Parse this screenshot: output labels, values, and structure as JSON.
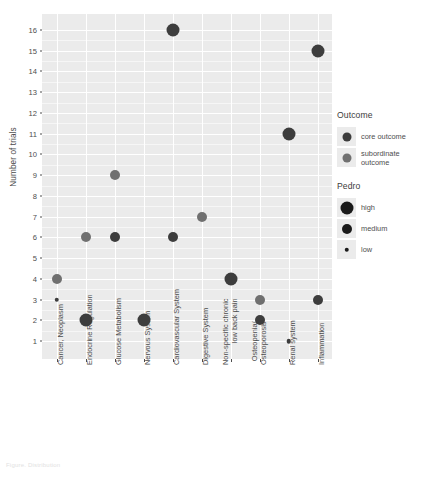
{
  "chart_data": {
    "type": "scatter",
    "title": "",
    "xlabel": "",
    "ylabel": "Number of trials",
    "ylim": [
      1,
      16
    ],
    "yticks": [
      1,
      2,
      3,
      4,
      5,
      6,
      7,
      8,
      9,
      10,
      11,
      12,
      13,
      14,
      15,
      16
    ],
    "grid": true,
    "legend_position": "right",
    "categories": [
      "Cancer, Neoplasm",
      "Endocrine Regulation",
      "Glucose Metabolism",
      "Nervous System",
      "Cardiovascular System",
      "Digestive System",
      "Non-specific chronic\nlow back pain",
      "Osteopenia/\nOsteoporosis",
      "Renal system",
      "Inflammation"
    ],
    "size_legend": {
      "title": "Pedro",
      "levels": [
        "high",
        "medium",
        "low"
      ],
      "diameters_px": [
        13,
        10,
        4.5
      ]
    },
    "color_legend": {
      "title": "Outcome",
      "levels": [
        "core outcome",
        "subordinate outcome"
      ],
      "colors": [
        "#3d3d3d",
        "#707070"
      ]
    },
    "points": [
      {
        "category": "Cancer, Neoplasm",
        "y": 4,
        "outcome": "subordinate outcome",
        "pedro": "medium"
      },
      {
        "category": "Cancer, Neoplasm",
        "y": 3,
        "outcome": "core outcome",
        "pedro": "low"
      },
      {
        "category": "Endocrine Regulation",
        "y": 6,
        "outcome": "subordinate outcome",
        "pedro": "medium"
      },
      {
        "category": "Endocrine Regulation",
        "y": 2,
        "outcome": "core outcome",
        "pedro": "high"
      },
      {
        "category": "Glucose Metabolism",
        "y": 9,
        "outcome": "subordinate outcome",
        "pedro": "medium"
      },
      {
        "category": "Glucose Metabolism",
        "y": 6,
        "outcome": "core outcome",
        "pedro": "medium"
      },
      {
        "category": "Nervous System",
        "y": 2,
        "outcome": "core outcome",
        "pedro": "high"
      },
      {
        "category": "Cardiovascular System",
        "y": 16,
        "outcome": "core outcome",
        "pedro": "high"
      },
      {
        "category": "Cardiovascular System",
        "y": 6,
        "outcome": "core outcome",
        "pedro": "medium"
      },
      {
        "category": "Digestive System",
        "y": 7,
        "outcome": "subordinate outcome",
        "pedro": "medium"
      },
      {
        "category": "Non-specific chronic\nlow back pain",
        "y": 4,
        "outcome": "core outcome",
        "pedro": "high"
      },
      {
        "category": "Osteopenia/\nOsteoporosis",
        "y": 3,
        "outcome": "subordinate outcome",
        "pedro": "medium"
      },
      {
        "category": "Osteopenia/\nOsteoporosis",
        "y": 2,
        "outcome": "core outcome",
        "pedro": "medium"
      },
      {
        "category": "Renal system",
        "y": 11,
        "outcome": "core outcome",
        "pedro": "high"
      },
      {
        "category": "Renal system",
        "y": 1,
        "outcome": "core outcome",
        "pedro": "low"
      },
      {
        "category": "Inflammation",
        "y": 15,
        "outcome": "core outcome",
        "pedro": "high"
      },
      {
        "category": "Inflammation",
        "y": 3,
        "outcome": "core outcome",
        "pedro": "medium"
      }
    ]
  },
  "axis": {
    "y_title": "Number of trials"
  },
  "legend": {
    "outcome": {
      "title": "Outcome",
      "items": [
        {
          "label": "core outcome",
          "color": "#3d3d3d",
          "size": 9
        },
        {
          "label": "subordinate outcome",
          "color": "#707070",
          "size": 9
        }
      ]
    },
    "pedro": {
      "title": "Pedro",
      "items": [
        {
          "label": "high",
          "color": "#1a1a1a",
          "size": 13
        },
        {
          "label": "medium",
          "color": "#1a1a1a",
          "size": 10
        },
        {
          "label": "low",
          "color": "#1a1a1a",
          "size": 4.5
        }
      ]
    }
  },
  "caption": "Figure. Distribution"
}
